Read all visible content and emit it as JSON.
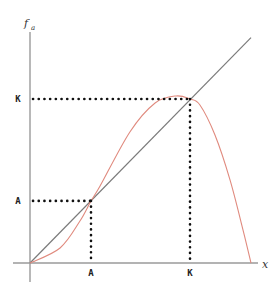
{
  "chart_data": {
    "type": "line",
    "title": "",
    "xlabel": "x",
    "ylabel": "f_a",
    "ylabel_main": "f",
    "ylabel_sub": "a",
    "xlim": [
      0,
      1.03
    ],
    "ylim": [
      0,
      1.02
    ],
    "grid": false,
    "series": [
      {
        "name": "identity",
        "color": "#7a7a7a",
        "x": [
          0,
          1.0
        ],
        "y": [
          0,
          1.02
        ]
      },
      {
        "name": "f_a",
        "color": "#e08a7e",
        "x": [
          0,
          0.136,
          0.226,
          0.276,
          0.317,
          0.452,
          0.566,
          0.661,
          0.724,
          0.769,
          0.837,
          0.905,
          0.964,
          1.0
        ],
        "y": [
          0,
          0.068,
          0.19,
          0.281,
          0.348,
          0.593,
          0.724,
          0.756,
          0.742,
          0.715,
          0.579,
          0.376,
          0.149,
          0
        ]
      }
    ],
    "fixed_points": [
      {
        "label": "A",
        "x": 0.276,
        "y": 0.281
      },
      {
        "label": "K",
        "x": 0.724,
        "y": 0.742
      }
    ],
    "x_tick_labels": [
      "A",
      "K"
    ],
    "y_tick_labels": [
      "A",
      "K"
    ]
  }
}
